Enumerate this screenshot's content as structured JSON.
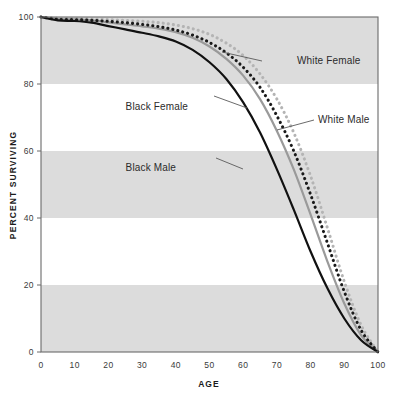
{
  "chart_data": {
    "type": "line",
    "title": "",
    "xlabel": "AGE",
    "ylabel": "PERCENT SURVIVING",
    "xlim": [
      0,
      100
    ],
    "ylim": [
      0,
      100
    ],
    "xticks": [
      0,
      10,
      20,
      30,
      40,
      50,
      60,
      70,
      80,
      90,
      100
    ],
    "yticks": [
      0,
      20,
      40,
      60,
      80,
      100
    ],
    "grid": false,
    "banded_background": true,
    "band_ranges": [
      [
        0,
        20
      ],
      [
        40,
        60
      ],
      [
        80,
        100
      ]
    ],
    "band_color": "#dcdcdc",
    "legend_position": "inline-annotations",
    "x": [
      0,
      5,
      10,
      15,
      20,
      25,
      30,
      35,
      40,
      45,
      50,
      55,
      60,
      65,
      70,
      75,
      80,
      85,
      90,
      95,
      100
    ],
    "series": [
      {
        "name": "White Female",
        "style": "dotted",
        "color": "#b4b4b4",
        "values": [
          100,
          99.6,
          99.5,
          99.4,
          99.2,
          99.0,
          98.7,
          98.3,
          97.6,
          96.5,
          94.8,
          92.2,
          88.5,
          83.0,
          75.5,
          65.5,
          52.5,
          37.0,
          21.0,
          8.0,
          0
        ]
      },
      {
        "name": "Black Female",
        "style": "dotted",
        "color": "#1a1a1a",
        "values": [
          100,
          99.3,
          99.2,
          99.0,
          98.7,
          98.3,
          97.8,
          97.1,
          96.1,
          94.6,
          92.4,
          89.3,
          85.0,
          79.0,
          70.5,
          60.0,
          47.0,
          32.5,
          18.0,
          6.5,
          0
        ]
      },
      {
        "name": "White Male",
        "style": "solid",
        "color": "#9a9a9a",
        "values": [
          100,
          99.4,
          99.3,
          99.0,
          98.4,
          97.8,
          97.2,
          96.5,
          95.5,
          93.8,
          91.2,
          87.5,
          82.5,
          75.5,
          66.0,
          54.5,
          41.0,
          27.0,
          14.5,
          5.0,
          0
        ]
      },
      {
        "name": "Black Male",
        "style": "solid",
        "color": "#111111",
        "values": [
          100,
          99.0,
          98.8,
          98.3,
          97.3,
          96.3,
          95.3,
          94.2,
          92.7,
          90.2,
          86.5,
          81.5,
          74.5,
          65.5,
          54.5,
          42.5,
          30.0,
          19.0,
          10.0,
          3.5,
          0
        ]
      }
    ],
    "annotations": [
      {
        "text": "White Female",
        "label_x": 297,
        "label_y": 64,
        "leader_from_x": 262,
        "leader_from_y": 61,
        "leader_to_x": 222,
        "leader_to_y": 52
      },
      {
        "text": "Black Female",
        "label_x": 188,
        "label_y": 110,
        "leader_from_x": 247,
        "leader_from_y": 108,
        "leader_to_x": 214,
        "leader_to_y": 96
      },
      {
        "text": "White Male",
        "label_x": 318,
        "label_y": 123,
        "leader_from_x": 314,
        "leader_from_y": 120,
        "leader_to_x": 277,
        "leader_to_y": 130
      },
      {
        "text": "Black Male",
        "label_x": 176,
        "label_y": 171,
        "leader_from_x": 243,
        "leader_from_y": 169,
        "leader_to_x": 216,
        "leader_to_y": 158
      }
    ]
  }
}
